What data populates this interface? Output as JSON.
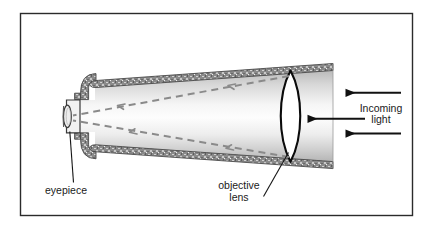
{
  "figure": {
    "type": "diagram",
    "border_color": "#2b2b2b",
    "background_color": "#ffffff"
  },
  "labels": {
    "eyepiece": "eyepiece",
    "objective_line1": "objective",
    "objective_line2": "lens",
    "incoming_line1": "Incoming",
    "incoming_line2": "light"
  },
  "parts": {
    "tube": {
      "name": "telescope-tube",
      "wall_color": "#7d7d7d",
      "interior_light": "#fbfbfb",
      "interior_dark": "#bdbdbd"
    },
    "objective_lens": {
      "name": "objective-lens",
      "outline_color": "#000000",
      "fill_color": "#ffffff"
    },
    "eyepiece": {
      "name": "eyepiece-barrel",
      "outline_color": "#3a3a3a"
    },
    "light_rays": {
      "name": "light-ray-dashed",
      "color": "#8a8a8a",
      "count": 2,
      "style": "dashed-with-arrowheads"
    },
    "incoming_arrows": {
      "name": "incoming-light-arrow",
      "color": "#111111",
      "count": 3,
      "direction": "left"
    }
  }
}
